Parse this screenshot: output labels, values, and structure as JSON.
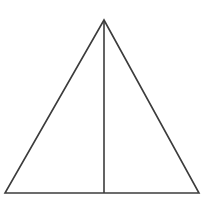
{
  "figure": {
    "title": "Isosceles triangle with median to the base",
    "background_color": "#ffffff",
    "stroke_color": "#3c3c3c",
    "stroke_width": 1.6,
    "canvas": {
      "width": 203,
      "height": 205
    },
    "labels": {
      "triangle": "triangle-outline",
      "median": "median-line"
    }
  },
  "chart_data": {
    "type": "diagram",
    "shape": "isosceles-triangle-with-median",
    "title": "",
    "grid": false,
    "legend": null,
    "axis": null,
    "vertices": [
      {
        "name": "apex",
        "x": 104,
        "y": 20
      },
      {
        "name": "bottom-left",
        "x": 5,
        "y": 193
      },
      {
        "name": "bottom-right",
        "x": 199,
        "y": 193
      }
    ],
    "segments": [
      {
        "name": "left-side",
        "from": [
          104,
          20
        ],
        "to": [
          5,
          193
        ]
      },
      {
        "name": "base",
        "from": [
          5,
          193
        ],
        "to": [
          199,
          193
        ]
      },
      {
        "name": "right-side",
        "from": [
          199,
          193
        ],
        "to": [
          104,
          20
        ]
      },
      {
        "name": "median",
        "from": [
          104,
          20
        ],
        "to": [
          104,
          193
        ]
      }
    ],
    "base_midpoint": {
      "x": 104,
      "y": 193
    },
    "measurements": {
      "base_length_px": 194,
      "height_px": 173
    }
  }
}
